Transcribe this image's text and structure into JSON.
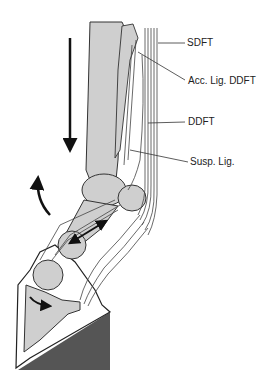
{
  "diagram": {
    "labels": [
      {
        "id": "sdft",
        "text": "SDFT",
        "x": 187,
        "y": 37
      },
      {
        "id": "acc-lig-ddft",
        "text": "Acc. Lig. DDFT",
        "x": 188,
        "y": 75
      },
      {
        "id": "ddft",
        "text": "DDFT",
        "x": 188,
        "y": 116
      },
      {
        "id": "susp-lig",
        "text": "Susp. Lig.",
        "x": 190,
        "y": 156
      }
    ],
    "colors": {
      "bone": "#cfcfcf",
      "outline": "#222222",
      "ground": "#555555",
      "tendon": "#444444"
    },
    "arrows": [
      {
        "name": "load-arrow-down",
        "direction": "down"
      },
      {
        "name": "rotation-arrow",
        "direction": "curved-up"
      },
      {
        "name": "pastern-double-arrow",
        "direction": "bidirectional"
      },
      {
        "name": "coffin-joint-arrow",
        "direction": "curved-right"
      }
    ]
  }
}
